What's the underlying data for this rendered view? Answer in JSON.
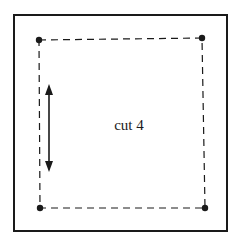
{
  "diagram": {
    "label": "cut 4",
    "colors": {
      "line": "#1a1a1a",
      "background": "#ffffff"
    },
    "outer_square": {
      "x": 14,
      "y": 15,
      "width": 213,
      "height": 216
    },
    "dashed_square_corners": [
      {
        "name": "top-left",
        "x": 39,
        "y": 40
      },
      {
        "name": "top-right",
        "x": 202,
        "y": 38
      },
      {
        "name": "bottom-right",
        "x": 205,
        "y": 208
      },
      {
        "name": "bottom-left",
        "x": 40,
        "y": 208
      }
    ],
    "arrow": {
      "x": 49,
      "y1": 84,
      "y2": 172,
      "direction": "double-headed vertical"
    }
  }
}
